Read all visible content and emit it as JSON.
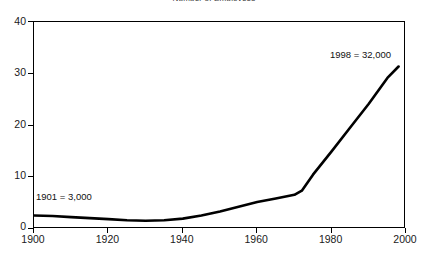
{
  "chart_data": {
    "type": "line",
    "title": "Number of Employees",
    "xlabel": "",
    "ylabel": "",
    "xlim": [
      1900,
      2000
    ],
    "ylim": [
      0,
      40
    ],
    "grid": false,
    "legend": "none",
    "xticks": [
      "1900",
      "1920",
      "1940",
      "1960",
      "1980",
      "2000"
    ],
    "yticks": [
      "0",
      "10",
      "20",
      "30",
      "40"
    ],
    "series": [
      {
        "name": "Employees (thousands)",
        "color": "#000000",
        "x": [
          1900,
          1905,
          1910,
          1915,
          1920,
          1925,
          1930,
          1935,
          1940,
          1945,
          1950,
          1955,
          1960,
          1965,
          1970,
          1972,
          1975,
          1980,
          1985,
          1990,
          1995,
          1998
        ],
        "values": [
          2.6,
          2.5,
          2.3,
          2.1,
          1.9,
          1.7,
          1.6,
          1.7,
          2.0,
          2.6,
          3.4,
          4.3,
          5.2,
          5.9,
          6.6,
          7.4,
          10.5,
          15.0,
          19.6,
          24.2,
          29.2,
          31.4
        ]
      }
    ],
    "annotations": [
      {
        "name": "start-point",
        "text": "1901 = 3,000",
        "x": 1901,
        "value": 3
      },
      {
        "name": "end-point",
        "text": "1998 = 32,000",
        "x": 1998,
        "value": 32
      }
    ]
  },
  "axes": {
    "y": {
      "ticks": [
        {
          "label": "40",
          "value": 40
        },
        {
          "label": "30",
          "value": 30
        },
        {
          "label": "20",
          "value": 20
        },
        {
          "label": "10",
          "value": 10
        },
        {
          "label": "0",
          "value": 0
        }
      ]
    },
    "x": {
      "ticks": [
        {
          "label": "1900",
          "value": 1900
        },
        {
          "label": "1920",
          "value": 1920
        },
        {
          "label": "1940",
          "value": 1940
        },
        {
          "label": "1960",
          "value": 1960
        },
        {
          "label": "1980",
          "value": 1980
        },
        {
          "label": "2000",
          "value": 2000
        }
      ]
    }
  },
  "style": {
    "line_color": "#000000",
    "axis_color": "#000000",
    "plot_background": "#ffffff",
    "page_background": "#ffffff",
    "text_color": "#111111"
  }
}
